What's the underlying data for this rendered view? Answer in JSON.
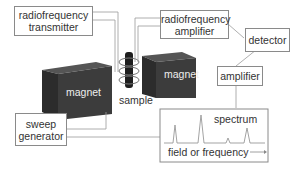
{
  "components": {
    "rf_transmitter": {
      "line1": "radiofrequency",
      "line2": "transmitter"
    },
    "rf_amplifier": {
      "line1": "radiofrequency",
      "line2": "amplifier"
    },
    "detector": {
      "label": "detector"
    },
    "amplifier": {
      "label": "amplifier"
    },
    "sweep_generator": {
      "line1": "sweep",
      "line2": "generator"
    },
    "magnet_left": {
      "label": "magnet"
    },
    "magnet_right": {
      "label": "magnet"
    },
    "sample": {
      "label": "sample"
    },
    "spectrum": {
      "title": "spectrum",
      "axis_label": "field or frequency"
    }
  },
  "colors": {
    "magnet": "#3a3a3a",
    "line": "#8a8a8a",
    "sample": "#1e1e1e"
  }
}
